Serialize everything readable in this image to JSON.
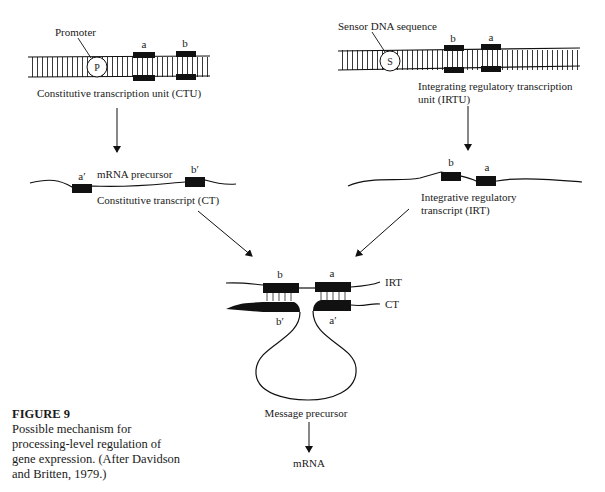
{
  "diagram": {
    "ctu": {
      "promoter_label": "Promoter",
      "promoter_symbol": "P",
      "region_a": "a",
      "region_b": "b",
      "caption": "Constitutive transcription unit (CTU)"
    },
    "irtu": {
      "sensor_label": "Sensor DNA sequence",
      "sensor_symbol": "S",
      "region_b": "b",
      "region_a": "a",
      "caption_line1": "Integrating regulatory transcription",
      "caption_line2": "unit (IRTU)"
    },
    "ct": {
      "region_a_prime": "a′",
      "region_b_prime": "b′",
      "label_top": "mRNA precursor",
      "label_bottom": "Constitutive transcript (CT)"
    },
    "irt": {
      "region_b": "b",
      "region_a": "a",
      "caption_line1": "Integrative regulatory",
      "caption_line2": "transcript (IRT)"
    },
    "duplex": {
      "label_b": "b",
      "label_a": "a",
      "label_b_prime": "b′",
      "label_a_prime": "a′",
      "irt_tag": "IRT",
      "ct_tag": "CT",
      "loop_label": "Message precursor",
      "product": "mRNA"
    }
  },
  "figure": {
    "title": "FIGURE 9",
    "caption": "Possible mechanism for processing-level regulation of gene expression. (After Davidson and Britten, 1979.)"
  }
}
